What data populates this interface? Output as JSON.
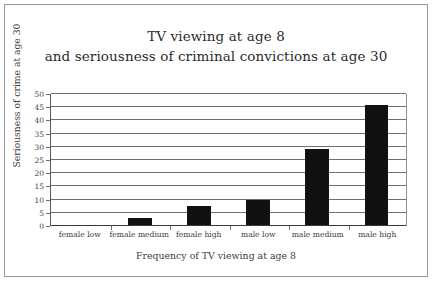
{
  "chart_data": {
    "type": "bar",
    "title": "TV viewing at age 8 and seriousness of criminal convictions at age 30",
    "title_lines": [
      "TV viewing at age 8",
      "and seriousness of criminal convictions at age 30"
    ],
    "categories": [
      "female low",
      "female medium",
      "female high",
      "male low",
      "male medium",
      "male high"
    ],
    "values": [
      0.4,
      3,
      7.7,
      10,
      29,
      45.8
    ],
    "xlabel": "Frequency of TV viewing at age 8",
    "ylabel": "Seriousness of crime at age 30",
    "ylim": [
      0,
      50
    ],
    "ytick_values": [
      0,
      5,
      10,
      15,
      20,
      25,
      30,
      35,
      40,
      45,
      50
    ],
    "ytick_labels": [
      "0",
      "5",
      "10",
      "15",
      "20",
      "25",
      "30",
      "35",
      "40",
      "45",
      "50"
    ],
    "grid": true,
    "legend": false,
    "bar_color": "#111111",
    "grid_color": "#6f6f6f",
    "border_color": "#9a9a9a"
  }
}
